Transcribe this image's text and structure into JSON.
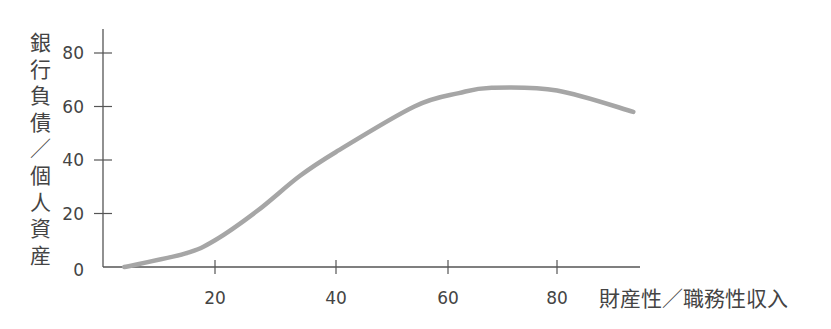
{
  "chart_data": {
    "type": "line",
    "title": "",
    "xlabel": "財産性／職務性収入",
    "ylabel": "銀行負債／個人資産",
    "xticks": [
      20,
      40,
      60,
      80
    ],
    "yticks": [
      0,
      20,
      40,
      60,
      80
    ],
    "xlim": [
      0,
      95
    ],
    "ylim": [
      0,
      85
    ],
    "grid": false,
    "legend": null,
    "series": [
      {
        "name": "curve",
        "color": "#a6a6a6",
        "x": [
          5,
          15,
          20,
          27,
          34,
          40,
          54,
          62,
          68,
          80,
          94
        ],
        "y": [
          0,
          5,
          10,
          21,
          34,
          43,
          60,
          65,
          67,
          66,
          58
        ]
      }
    ]
  }
}
